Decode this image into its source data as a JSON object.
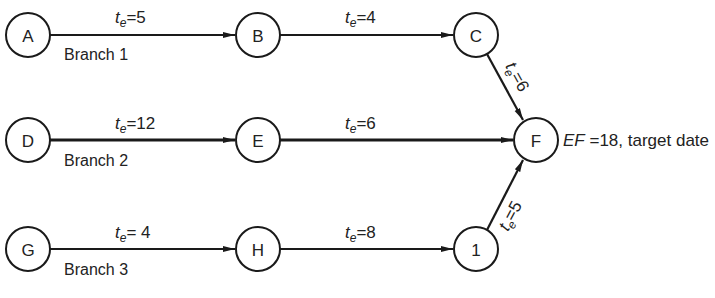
{
  "diagram": {
    "type": "network-pert",
    "nodes": [
      {
        "id": "A",
        "label": "A",
        "x": 28,
        "y": 35
      },
      {
        "id": "B",
        "label": "B",
        "x": 258,
        "y": 35
      },
      {
        "id": "C",
        "label": "C",
        "x": 476,
        "y": 35
      },
      {
        "id": "D",
        "label": "D",
        "x": 28,
        "y": 140
      },
      {
        "id": "E",
        "label": "E",
        "x": 258,
        "y": 140
      },
      {
        "id": "F",
        "label": "F",
        "x": 536,
        "y": 140
      },
      {
        "id": "G",
        "label": "G",
        "x": 28,
        "y": 249
      },
      {
        "id": "H",
        "label": "H",
        "x": 258,
        "y": 249
      },
      {
        "id": "I",
        "label": "1",
        "x": 476,
        "y": 249
      }
    ],
    "edges": [
      {
        "from": "A",
        "to": "B",
        "te_prefix": "t",
        "te_sub": "e",
        "te_value": "=5"
      },
      {
        "from": "B",
        "to": "C",
        "te_prefix": "t",
        "te_sub": "e",
        "te_value": "=4"
      },
      {
        "from": "C",
        "to": "F",
        "te_prefix": "t",
        "te_sub": "e",
        "te_value": "=6"
      },
      {
        "from": "D",
        "to": "E",
        "te_prefix": "t",
        "te_sub": "e",
        "te_value": "=12"
      },
      {
        "from": "E",
        "to": "F",
        "te_prefix": "t",
        "te_sub": "e",
        "te_value": "=6"
      },
      {
        "from": "G",
        "to": "H",
        "te_prefix": "t",
        "te_sub": "e",
        "te_value": "= 4"
      },
      {
        "from": "H",
        "to": "I",
        "te_prefix": "t",
        "te_sub": "e",
        "te_value": "=8"
      },
      {
        "from": "I",
        "to": "F",
        "te_prefix": "t",
        "te_sub": "e",
        "te_value": "=5"
      }
    ],
    "branches": [
      {
        "label": "Branch 1"
      },
      {
        "label": "Branch 2"
      },
      {
        "label": "Branch 3"
      }
    ],
    "ef_annotation": {
      "ef_label": "EF",
      "ef_rest": " =18, target date"
    }
  }
}
